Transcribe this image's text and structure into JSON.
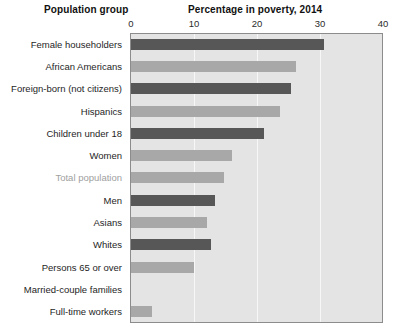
{
  "titles": {
    "left_column": "Population group",
    "chart": "Percentage in poverty, 2014"
  },
  "chart_data": {
    "type": "bar",
    "orientation": "horizontal",
    "title": "Percentage in poverty, 2014",
    "xlabel": "Percentage in poverty, 2014",
    "ylabel": "Population group",
    "xlim": [
      0,
      40
    ],
    "xticks": [
      0,
      10,
      20,
      30,
      40
    ],
    "xtick_labels": [
      "0",
      "10",
      "20",
      "30",
      "40"
    ],
    "grid": true,
    "grid_axis": "x",
    "legend": "none",
    "categories": [
      "Female householders",
      "African Americans",
      "Foreign-born (not citizens)",
      "Hispanics",
      "Children under 18",
      "Women",
      "Total population",
      "Men",
      "Asians",
      "Whites",
      "Persons 65 or over",
      "Married-couple families",
      "Full-time workers"
    ],
    "values": [
      30.6,
      26.2,
      25.4,
      23.6,
      21.1,
      16.1,
      14.8,
      13.4,
      12.0,
      12.7,
      10.0,
      0.0,
      3.4
    ],
    "bar_colors": [
      "#575757",
      "#a8a8a8",
      "#575757",
      "#a8a8a8",
      "#575757",
      "#a8a8a8",
      "#a8a8a8",
      "#575757",
      "#a8a8a8",
      "#575757",
      "#a8a8a8",
      "#a8a8a8",
      "#a8a8a8"
    ],
    "bar_shades": [
      "dark",
      "light",
      "dark",
      "light",
      "dark",
      "light",
      "light",
      "dark",
      "light",
      "dark",
      "light",
      "light",
      "light"
    ],
    "highlighted_category": "Total population",
    "highlight_label_color": "#a0a0a0",
    "plot_background": "#e4e4e4",
    "gridline_color": "#f7f7f7",
    "axis_border_color": "#8c8c8c"
  }
}
